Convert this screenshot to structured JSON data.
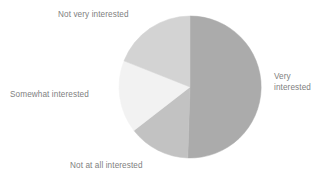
{
  "chart_data": {
    "type": "pie",
    "title": "",
    "subtitle": "",
    "xlabel": "",
    "ylabel": "",
    "grid": false,
    "legend_position": "none",
    "label_placement": "outside",
    "start_angle_deg": 0,
    "direction": "clockwise",
    "center": {
      "x": 190,
      "y": 87
    },
    "radius": 71,
    "categories": [
      "Very interested",
      "Not at all interested",
      "Somewhat interested",
      "Not very interested"
    ],
    "values": [
      50.5,
      14,
      16.5,
      19
    ],
    "units": "percent",
    "slices": [
      {
        "label": "Very interested",
        "label_display": "Very\ninterested",
        "value": 50.5,
        "color": "#ABABAB",
        "start_deg": 0,
        "end_deg": 181.8,
        "label_side": "right"
      },
      {
        "label": "Not at all interested",
        "label_display": "Not at all interested",
        "value": 14,
        "color": "#C2C2C2",
        "start_deg": 181.8,
        "end_deg": 232.2,
        "label_side": "bottom"
      },
      {
        "label": "Somewhat interested",
        "label_display": "Somewhat interested",
        "value": 16.5,
        "color": "#F2F2F2",
        "start_deg": 232.2,
        "end_deg": 291.6,
        "label_side": "left"
      },
      {
        "label": "Not very interested",
        "label_display": "Not very interested",
        "value": 19,
        "color": "#D3D3D3",
        "start_deg": 291.6,
        "end_deg": 360,
        "label_side": "top"
      }
    ]
  },
  "figure": {
    "background_color": "#FFFFFF",
    "label_color": "#808080"
  }
}
